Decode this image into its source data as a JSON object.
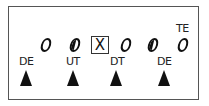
{
  "diagram": {
    "title": "",
    "offense": [
      {
        "id": "o1",
        "symbol": "O",
        "style": "open"
      },
      {
        "id": "o2",
        "symbol": "O",
        "style": "half-filled"
      },
      {
        "id": "center",
        "symbol": "X",
        "style": "boxed"
      },
      {
        "id": "o4",
        "symbol": "O",
        "style": "open"
      },
      {
        "id": "o5",
        "symbol": "O",
        "style": "half-filled"
      },
      {
        "id": "te",
        "symbol": "O",
        "style": "open",
        "label": "TE"
      }
    ],
    "defense": [
      {
        "label": "DE",
        "symbol": "triangle"
      },
      {
        "label": "UT",
        "symbol": "triangle"
      },
      {
        "label": "DT",
        "symbol": "triangle"
      },
      {
        "label": "DE",
        "symbol": "triangle"
      }
    ],
    "center_symbol": "X",
    "te_label": "TE"
  }
}
